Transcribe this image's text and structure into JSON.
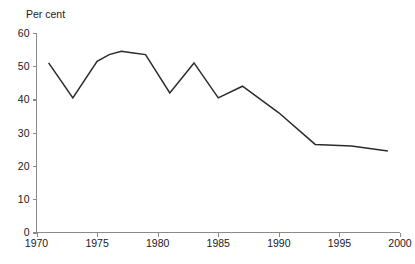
{
  "chart_data": {
    "type": "line",
    "title": "",
    "ylabel": "Per cent",
    "xlabel": "",
    "xlim": [
      1970,
      2000
    ],
    "ylim": [
      0,
      60
    ],
    "grid": false,
    "legend": null,
    "yticks": [
      0,
      10,
      20,
      30,
      40,
      50,
      60
    ],
    "ytick_labels": [
      "0",
      "10",
      "20",
      "30",
      "40",
      "50",
      "60"
    ],
    "xticks": [
      1970,
      1975,
      1980,
      1985,
      1990,
      1995,
      2000
    ],
    "xtick_labels": [
      "1970",
      "1975",
      "1980",
      "1985",
      "1990",
      "1995",
      "2000"
    ],
    "series": [
      {
        "name": "Per cent",
        "color": "#2b2b2b",
        "x": [
          1971,
          1973,
          1975,
          1976,
          1977,
          1978,
          1979,
          1981,
          1983,
          1985,
          1987,
          1990,
          1993,
          1996,
          1999
        ],
        "values": [
          51.0,
          40.5,
          51.5,
          53.5,
          54.5,
          54.0,
          53.5,
          42.0,
          51.0,
          40.5,
          44.0,
          36.0,
          26.5,
          26.0,
          24.5
        ]
      }
    ]
  },
  "axis": {
    "y_title": "Per cent"
  }
}
